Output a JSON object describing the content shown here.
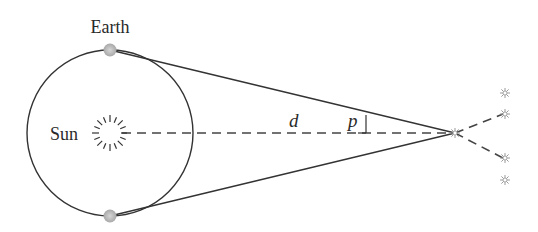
{
  "diagram": {
    "labels": {
      "earth": "Earth",
      "sun": "Sun",
      "distance": "d",
      "parallax_angle": "p"
    },
    "elements": {
      "orbit": {
        "cx": 110,
        "cy": 133,
        "r": 83
      },
      "earth_positions": [
        {
          "x": 110,
          "y": 50
        },
        {
          "x": 110,
          "y": 216
        }
      ],
      "sun": {
        "x": 110,
        "y": 133
      },
      "nearby_star": {
        "x": 455,
        "y": 133
      },
      "distant_stars": [
        {
          "x": 505,
          "y": 93
        },
        {
          "x": 505,
          "y": 114
        },
        {
          "x": 505,
          "y": 158
        },
        {
          "x": 505,
          "y": 180
        }
      ]
    },
    "colors": {
      "line": "#333333",
      "earth": "#b8b8b8",
      "star": "#9a9a9a"
    }
  }
}
